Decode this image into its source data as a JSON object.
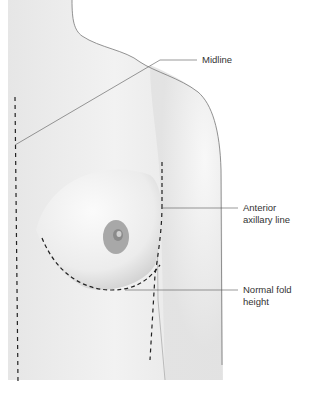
{
  "figure": {
    "colors": {
      "background": "#ffffff",
      "skin": "#eeeeee",
      "skin_shadow": "#d6d6d6",
      "outline": "#555555",
      "dashed_line": "#222222",
      "areola": "#a8a8a8",
      "label_text": "#333333",
      "leader_line": "#555555"
    }
  },
  "labels": {
    "midline": "Midline",
    "anterior_axillary_line_1": "Anterior",
    "anterior_axillary_line_2": "axillary line",
    "normal_fold_height_1": "Normal fold",
    "normal_fold_height_2": "height"
  }
}
